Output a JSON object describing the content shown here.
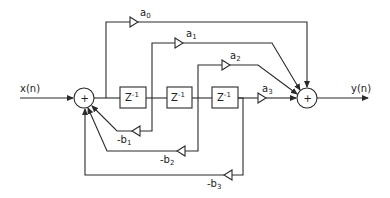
{
  "diagram": {
    "type": "IIR direct form filter block diagram",
    "input_label": "x(n)",
    "output_label": "y(n)",
    "summing_junction_symbol": "+",
    "delay_label": "Z",
    "delay_exponent": "-1",
    "feedforward_gains": [
      {
        "base": "a",
        "sub": "0"
      },
      {
        "base": "a",
        "sub": "1"
      },
      {
        "base": "a",
        "sub": "2"
      },
      {
        "base": "a",
        "sub": "3"
      }
    ],
    "feedback_gains": [
      {
        "base": "-b",
        "sub": "1"
      },
      {
        "base": "-b",
        "sub": "2"
      },
      {
        "base": "-b",
        "sub": "3"
      }
    ],
    "nodes": [
      {
        "id": "sum-in",
        "label": "+"
      },
      {
        "id": "delay-1",
        "label": "Z^-1"
      },
      {
        "id": "delay-2",
        "label": "Z^-1"
      },
      {
        "id": "delay-3",
        "label": "Z^-1"
      },
      {
        "id": "sum-out",
        "label": "+"
      }
    ],
    "colors": {
      "line": "#2a2a2a",
      "background": "#ffffff"
    }
  }
}
